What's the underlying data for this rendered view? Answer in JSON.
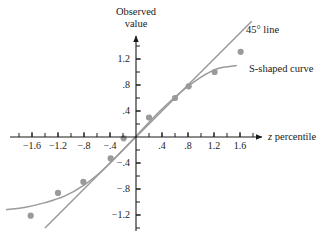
{
  "chart_data": {
    "type": "scatter",
    "title": "",
    "xlabel": "z percentile",
    "ylabel": "Observed value",
    "xlim": [
      -2.0,
      1.9
    ],
    "ylim": [
      -1.45,
      1.55
    ],
    "grid": false,
    "legend_position": "inside-right",
    "xticks": [
      -1.6,
      -1.2,
      -0.8,
      -0.4,
      0.4,
      0.8,
      1.2,
      1.6
    ],
    "xtick_labels": [
      "−1.6",
      "−1.2",
      "−.8",
      "−.4",
      ".4",
      ".8",
      "1.2",
      "1.6"
    ],
    "yticks": [
      -1.2,
      -0.8,
      -0.4,
      0.4,
      0.8,
      1.2
    ],
    "ytick_labels": [
      "−1.2",
      "−.8",
      "−.4",
      ".4",
      ".8",
      "1.2"
    ],
    "minor_tick_step": 0.2,
    "point_color": "#9a9a9a",
    "line_color": "#9a9a9a",
    "curve_color": "#9a9a9a",
    "axis_color": "#1a1a1a",
    "points": [
      {
        "x": -1.62,
        "y": -1.21
      },
      {
        "x": -1.2,
        "y": -0.86
      },
      {
        "x": -0.81,
        "y": -0.69
      },
      {
        "x": -0.39,
        "y": -0.33
      },
      {
        "x": -0.19,
        "y": -0.02
      },
      {
        "x": 0.2,
        "y": 0.3
      },
      {
        "x": 0.6,
        "y": 0.6
      },
      {
        "x": 0.81,
        "y": 0.78
      },
      {
        "x": 1.21,
        "y": 1.0
      },
      {
        "x": 1.61,
        "y": 1.31
      }
    ],
    "reference_line": {
      "name": "45° line",
      "slope": 1.0,
      "intercept": 0.0,
      "x_start": -1.4,
      "x_end": 1.78
    },
    "s_curve": {
      "name": "S-shaped curve",
      "x_start": -2.0,
      "x_end": 1.55,
      "points": [
        {
          "x": -2.0,
          "y": -1.12
        },
        {
          "x": -1.7,
          "y": -1.08
        },
        {
          "x": -1.4,
          "y": -1.01
        },
        {
          "x": -1.1,
          "y": -0.91
        },
        {
          "x": -0.8,
          "y": -0.74
        },
        {
          "x": -0.5,
          "y": -0.5
        },
        {
          "x": -0.2,
          "y": -0.2
        },
        {
          "x": 0.1,
          "y": 0.12
        },
        {
          "x": 0.4,
          "y": 0.43
        },
        {
          "x": 0.7,
          "y": 0.7
        },
        {
          "x": 1.0,
          "y": 0.92
        },
        {
          "x": 1.25,
          "y": 1.05
        },
        {
          "x": 1.55,
          "y": 1.1
        }
      ]
    },
    "annotations": [
      {
        "name": "45° line",
        "text": "45° line"
      },
      {
        "name": "S-shaped curve",
        "text": "S-shaped curve"
      }
    ]
  },
  "axis_labels": {
    "y_line1": "Observed",
    "y_line2": "value",
    "x_italic": "z",
    "x_rest": " percentile"
  },
  "legend": {
    "line_label": "45° line",
    "curve_label": "S-shaped curve"
  }
}
